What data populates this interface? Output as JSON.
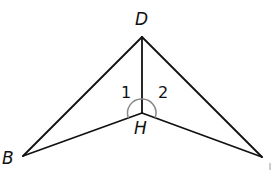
{
  "diagram": {
    "type": "geometry",
    "points": {
      "D": {
        "label": "D",
        "x": 142,
        "y": 37
      },
      "H": {
        "label": "H",
        "x": 142,
        "y": 113
      },
      "B": {
        "label": "B",
        "x": 23,
        "y": 156
      },
      "R": {
        "label": "",
        "x": 262,
        "y": 157
      }
    },
    "segments": [
      {
        "from": "D",
        "to": "B"
      },
      {
        "from": "D",
        "to": "R"
      },
      {
        "from": "D",
        "to": "H"
      },
      {
        "from": "H",
        "to": "B"
      },
      {
        "from": "H",
        "to": "R"
      }
    ],
    "angles": [
      {
        "label": "1",
        "vertex": "H",
        "between": [
          "D",
          "B"
        ]
      },
      {
        "label": "2",
        "vertex": "H",
        "between": [
          "D",
          "R"
        ]
      }
    ],
    "colors": {
      "line": "#111111",
      "arc": "#888888",
      "background": "#ffffff"
    }
  }
}
